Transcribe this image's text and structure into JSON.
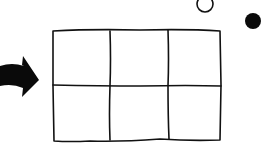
{
  "diagram": {
    "grid": {
      "rows": 2,
      "cols": 3,
      "stroke": "#111111"
    },
    "arrow": {
      "direction": "right",
      "color": "#0a0a0a"
    },
    "open_circle": {
      "fill": "none",
      "stroke": "#111111"
    },
    "filled_circle": {
      "fill": "#0a0a0a"
    }
  }
}
